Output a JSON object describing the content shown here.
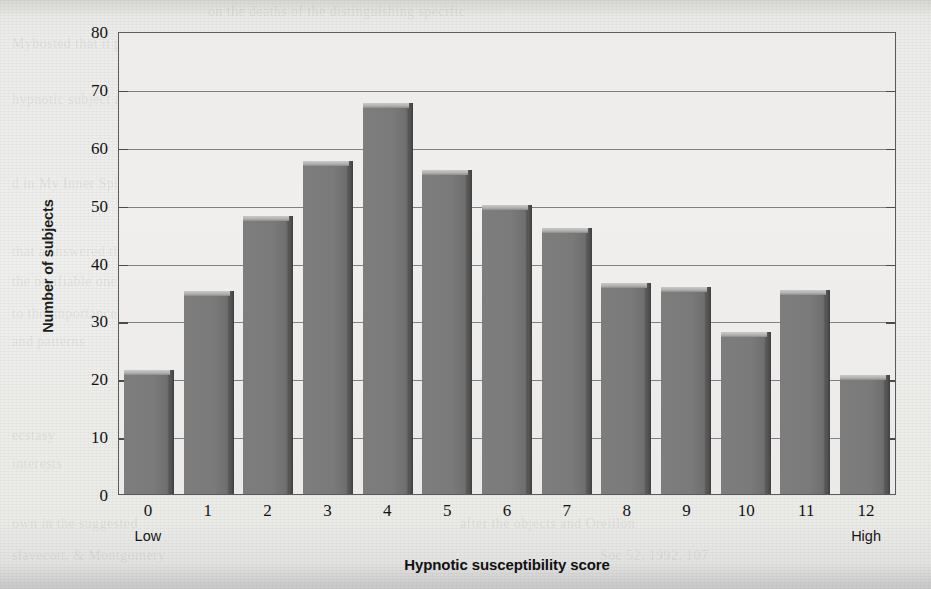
{
  "chart_data": {
    "type": "bar",
    "title": "",
    "xlabel": "Hypnotic susceptibility score",
    "ylabel": "Number of subjects",
    "categories": [
      "0",
      "1",
      "2",
      "3",
      "4",
      "5",
      "6",
      "7",
      "8",
      "9",
      "10",
      "11",
      "12"
    ],
    "values": [
      21.5,
      35,
      48,
      57.5,
      67.5,
      56,
      50,
      46,
      36.5,
      35.8,
      28,
      35.3,
      20.5
    ],
    "ylim": [
      0,
      80
    ],
    "yticks": [
      0,
      10,
      20,
      30,
      40,
      50,
      60,
      70,
      80
    ],
    "ytick_labels": [
      "0",
      "10",
      "20",
      "30",
      "40",
      "50",
      "60",
      "70",
      "80"
    ],
    "xtick_labels": [
      "0",
      "1",
      "2",
      "3",
      "4",
      "5",
      "6",
      "7",
      "8",
      "9",
      "10",
      "11",
      "12"
    ],
    "x_sublabels": [
      "Low",
      "",
      "",
      "",
      "",
      "",
      "",
      "",
      "",
      "",
      "",
      "",
      "High"
    ],
    "grid": true,
    "gridlines_at": [
      10,
      20,
      30,
      40,
      50,
      60,
      70
    ],
    "legend": null,
    "legend_position": "none",
    "bar_color": "#7a7a7a",
    "bar_top_color": "#b8b8b6",
    "bar_edge_color": "#464646",
    "plot_background": "#eeedec",
    "frame_color": "#5a5a5a"
  },
  "axis": {
    "y_title": "Number of subjects",
    "x_title": "Hypnotic susceptibility score",
    "low_label": "Low",
    "high_label": "High"
  },
  "page": {
    "background_color": "#efefed",
    "ghost_text": [
      {
        "text": "on the deaths of the distinguishing specific",
        "x": 208,
        "y": 4
      },
      {
        "text": "Mybosted that it possible.",
        "x": 12,
        "y": 36
      },
      {
        "text": "the chief and the well Marie white makes have",
        "x": 208,
        "y": 36
      },
      {
        "text": "hypnotic subject and relaxed as",
        "x": 12,
        "y": 92
      },
      {
        "text": "Oxford paying that to be more terrful than defend",
        "x": 208,
        "y": 92
      },
      {
        "text": "d in My Inner Spirit in (1990)",
        "x": 12,
        "y": 176
      },
      {
        "text": "usually been that subject of hypnotic suggestion",
        "x": 208,
        "y": 176
      },
      {
        "text": "that a answered that and",
        "x": 12,
        "y": 244
      },
      {
        "text": "the notifiable ones can",
        "x": 12,
        "y": 274
      },
      {
        "text": "to the importance",
        "x": 12,
        "y": 306
      },
      {
        "text": "and patterns",
        "x": 12,
        "y": 334
      },
      {
        "text": "ecstasy",
        "x": 12,
        "y": 428
      },
      {
        "text": "and the patient that",
        "x": 660,
        "y": 428
      },
      {
        "text": "interests",
        "x": 12,
        "y": 456
      },
      {
        "text": "own in the suggested",
        "x": 12,
        "y": 516
      },
      {
        "text": "after the objects and Oreillon",
        "x": 460,
        "y": 516
      },
      {
        "text": "slavecott, & Montgomery",
        "x": 12,
        "y": 548
      },
      {
        "text": "Soc 52, 1992, 107",
        "x": 600,
        "y": 548
      }
    ]
  }
}
